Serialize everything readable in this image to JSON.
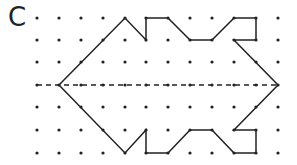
{
  "label": "C",
  "grid": {
    "columns_x": [
      37,
      59,
      81,
      103,
      125,
      146,
      168,
      190,
      212,
      234,
      256,
      278
    ],
    "rows_y": [
      18,
      40,
      62,
      85,
      107,
      130,
      153
    ],
    "dot_color": "#222222"
  },
  "symmetry_line": {
    "y": 85,
    "x1": 37,
    "x2": 278,
    "style": "dashed"
  },
  "shape_points": [
    [
      59,
      85
    ],
    [
      125,
      18
    ],
    [
      146,
      40
    ],
    [
      146,
      18
    ],
    [
      168,
      18
    ],
    [
      190,
      40
    ],
    [
      212,
      40
    ],
    [
      234,
      18
    ],
    [
      256,
      18
    ],
    [
      256,
      40
    ],
    [
      234,
      40
    ],
    [
      278,
      85
    ],
    [
      234,
      130
    ],
    [
      256,
      130
    ],
    [
      256,
      153
    ],
    [
      234,
      153
    ],
    [
      212,
      130
    ],
    [
      190,
      130
    ],
    [
      168,
      153
    ],
    [
      146,
      153
    ],
    [
      146,
      130
    ],
    [
      125,
      153
    ],
    [
      59,
      85
    ]
  ]
}
